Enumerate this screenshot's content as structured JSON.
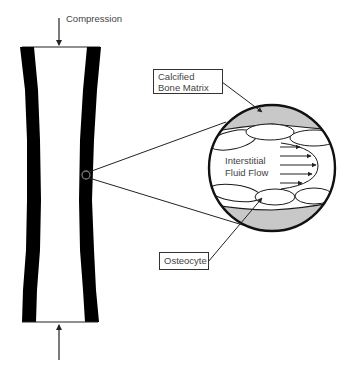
{
  "diagram": {
    "labels": {
      "compression": "Compression",
      "calcified_bone_matrix": "Calcified Bone Matrix",
      "interstitial_fluid_flow": "Interstitial Fluid Flow",
      "osteocyte": "Osteocyte"
    },
    "colors": {
      "bone_wall": "#000000",
      "matrix_fill": "#c8c8c8",
      "stroke": "#1a1a1a",
      "text": "#444444",
      "lens_circle": "#777777"
    },
    "elements": {
      "bone_shaft": "hollow long-bone cross-section with thick dark walls",
      "top_load_arrow": "downward arrow onto top plate",
      "bottom_load_arrow": "upward arrow onto bottom plate",
      "magnifier_circle": "enlarged view of a region of cortical bone",
      "fluid_arrows_count": 5,
      "osteocyte_lacunae_top": 3,
      "osteocyte_lacunae_bottom": 3
    }
  }
}
